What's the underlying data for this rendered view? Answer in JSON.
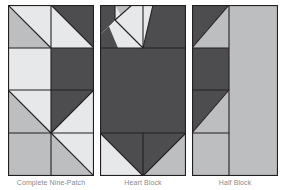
{
  "figure": {
    "background": "#ffffff",
    "panel_count": 3,
    "stroke_color": "#231f20",
    "stroke_width": 1.1
  },
  "palette": {
    "dark_gray": "#4d4d4f",
    "mid_gray": "#bcbec0",
    "light_gray": "#d9dadb",
    "pale_gray": "#e7e8e9",
    "outline": "#231f20",
    "caption_text": "#8a8c8e"
  },
  "captions": {
    "panel1": "Complete Nine-Patch",
    "panel2": "Heart Block",
    "panel3": "Half Block"
  },
  "panels": [
    {
      "name": "panel-one-nine-patch",
      "x": 8,
      "y": 5,
      "width": 86,
      "height": 171,
      "cols": 2,
      "rows": 4,
      "cells": [
        {
          "r": 0,
          "c": 0,
          "type": "hst",
          "orientation": "tl-br",
          "fill_a": "mid_gray",
          "fill_b": "pale_gray"
        },
        {
          "r": 0,
          "c": 1,
          "type": "hst",
          "orientation": "tl-br",
          "fill_a": "pale_gray",
          "fill_b": "dark_gray"
        },
        {
          "r": 1,
          "c": 0,
          "type": "solid",
          "fill_a": "pale_gray"
        },
        {
          "r": 1,
          "c": 1,
          "type": "solid",
          "fill_a": "dark_gray"
        },
        {
          "r": 2,
          "c": 0,
          "type": "hst",
          "orientation": "tl-br",
          "fill_a": "mid_gray",
          "fill_b": "pale_gray"
        },
        {
          "r": 2,
          "c": 1,
          "type": "hst",
          "orientation": "bl-tr",
          "fill_a": "pale_gray",
          "fill_b": "dark_gray"
        },
        {
          "r": 3,
          "c": 0,
          "type": "solid",
          "fill_a": "mid_gray"
        },
        {
          "r": 3,
          "c": 1,
          "type": "hst",
          "orientation": "tl-br",
          "fill_a": "mid_gray",
          "fill_b": "pale_gray"
        }
      ]
    },
    {
      "name": "panel-two-heart-block",
      "x": 100,
      "y": 5,
      "width": 86,
      "height": 171,
      "description": "Dark heart / arrow motif on pale ground",
      "shapes": [
        {
          "id": "top-left-dark",
          "fill": "dark_gray"
        },
        {
          "id": "top-left-notch",
          "fill": "mid_gray"
        },
        {
          "id": "top-center-wedge",
          "fill": "pale_gray"
        },
        {
          "id": "top-right-wedge",
          "fill": "pale_gray"
        },
        {
          "id": "top-right-dark",
          "fill": "dark_gray"
        },
        {
          "id": "body",
          "fill": "dark_gray"
        },
        {
          "id": "bottom-left-ground",
          "fill": "pale_gray"
        },
        {
          "id": "bottom-right-ground",
          "fill": "mid_gray"
        },
        {
          "id": "bottom-point",
          "fill": "dark_gray"
        }
      ]
    },
    {
      "name": "panel-three-half-block",
      "x": 192,
      "y": 5,
      "width": 86,
      "height": 171,
      "columns": [
        {
          "id": "left-column",
          "width_fraction": 0.43
        },
        {
          "id": "right-column",
          "width_fraction": 0.57,
          "fill": "mid_gray"
        }
      ],
      "cells": [
        {
          "r": 0,
          "type": "hst",
          "orientation": "tl-br",
          "fill_a": "dark_gray",
          "fill_b": "mid_gray"
        },
        {
          "r": 1,
          "type": "solid",
          "fill_a": "dark_gray"
        },
        {
          "r": 2,
          "type": "hst",
          "orientation": "bl-tr",
          "fill_a": "dark_gray",
          "fill_b": "mid_gray"
        },
        {
          "r": 3,
          "type": "solid",
          "fill_a": "mid_gray"
        }
      ]
    }
  ]
}
